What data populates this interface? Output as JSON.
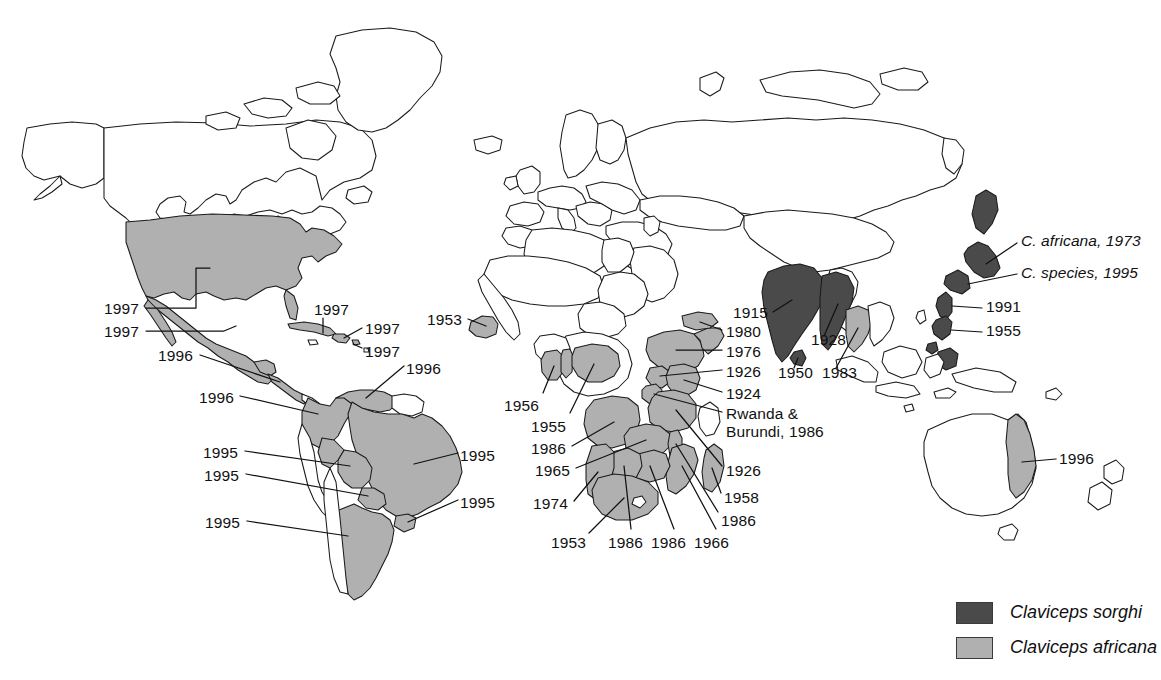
{
  "figure": {
    "colors": {
      "sorghi": "#4a4a4a",
      "africana": "#b0b0b0",
      "outline": "#1a1a1a",
      "background": "#ffffff",
      "text": "#111111"
    }
  },
  "legend": {
    "items": [
      {
        "key": "sorghi",
        "label": "Claviceps sorghi",
        "color": "#4a4a4a"
      },
      {
        "key": "africana",
        "label": "Claviceps africana",
        "color": "#b0b0b0"
      }
    ]
  },
  "annotations": [
    {
      "id": "usa",
      "label": "1997",
      "region": "United States",
      "species": "africana",
      "x": 104,
      "y": 300
    },
    {
      "id": "mexico",
      "label": "1997",
      "region": "Mexico",
      "species": "africana",
      "x": 104,
      "y": 323
    },
    {
      "id": "cuba",
      "label": "1997",
      "region": "Cuba",
      "species": "africana",
      "x": 314,
      "y": 301
    },
    {
      "id": "haiti-dr",
      "label": "1997",
      "region": "Hispaniola",
      "species": "africana",
      "x": 365,
      "y": 320
    },
    {
      "id": "puerto-rico",
      "label": "1997",
      "region": "Puerto Rico",
      "species": "africana",
      "x": 365,
      "y": 343
    },
    {
      "id": "central-america",
      "label": "1996",
      "region": "Central America",
      "species": "africana",
      "x": 158,
      "y": 347
    },
    {
      "id": "venezuela",
      "label": "1996",
      "region": "Venezuela",
      "species": "africana",
      "x": 406,
      "y": 360
    },
    {
      "id": "colombia",
      "label": "1996",
      "region": "Colombia",
      "species": "africana",
      "x": 199,
      "y": 389
    },
    {
      "id": "bolivia",
      "label": "1995",
      "region": "Bolivia",
      "species": "africana",
      "x": 203,
      "y": 444
    },
    {
      "id": "brazil",
      "label": "1995",
      "region": "Brazil",
      "species": "africana",
      "x": 460,
      "y": 447
    },
    {
      "id": "paraguay",
      "label": "1995",
      "region": "Paraguay",
      "species": "africana",
      "x": 204,
      "y": 467
    },
    {
      "id": "uruguay",
      "label": "1995",
      "region": "Uruguay",
      "species": "africana",
      "x": 460,
      "y": 494
    },
    {
      "id": "argentina",
      "label": "1995",
      "region": "Argentina",
      "species": "africana",
      "x": 205,
      "y": 514
    },
    {
      "id": "senegal-gambia",
      "label": "1953",
      "region": "Senegal / Gambia",
      "species": "africana",
      "x": 427,
      "y": 311
    },
    {
      "id": "ghana-togo",
      "label": "1956",
      "region": "Ghana / Togo",
      "species": "africana",
      "x": 504,
      "y": 397
    },
    {
      "id": "nigeria",
      "label": "1955",
      "region": "Nigeria",
      "species": "africana",
      "x": 531,
      "y": 418
    },
    {
      "id": "angola",
      "label": "1986",
      "region": "Angola",
      "species": "africana",
      "x": 531,
      "y": 440
    },
    {
      "id": "zambia",
      "label": "1965",
      "region": "Zambia",
      "species": "africana",
      "x": 535,
      "y": 462
    },
    {
      "id": "namibia",
      "label": "1974",
      "region": "Namibia",
      "species": "africana",
      "x": 533,
      "y": 495
    },
    {
      "id": "south-africa",
      "label": "1953",
      "region": "South Africa",
      "species": "africana",
      "x": 551,
      "y": 534
    },
    {
      "id": "botswana",
      "label": "1986",
      "region": "Botswana",
      "species": "africana",
      "x": 608,
      "y": 534
    },
    {
      "id": "zimbabwe",
      "label": "1986",
      "region": "Zimbabwe",
      "species": "africana",
      "x": 651,
      "y": 534
    },
    {
      "id": "mozambique",
      "label": "1966",
      "region": "Mozambique",
      "species": "africana",
      "x": 694,
      "y": 534
    },
    {
      "id": "malawi",
      "label": "1986",
      "region": "Malawi",
      "species": "africana",
      "x": 721,
      "y": 512
    },
    {
      "id": "madagascar",
      "label": "1958",
      "region": "Madagascar",
      "species": "africana",
      "x": 724,
      "y": 489
    },
    {
      "id": "tanzania",
      "label": "1926",
      "region": "Tanzania",
      "species": "africana",
      "x": 726,
      "y": 462
    },
    {
      "id": "rwanda-burundi",
      "label": "Rwanda &\nBurundi, 1986",
      "region": "Rwanda and Burundi",
      "species": "africana",
      "x": 726,
      "y": 412
    },
    {
      "id": "kenya",
      "label": "1924",
      "region": "Kenya",
      "species": "africana",
      "x": 726,
      "y": 393
    },
    {
      "id": "uganda",
      "label": "1926",
      "region": "Uganda",
      "species": "africana",
      "x": 726,
      "y": 372
    },
    {
      "id": "ethiopia",
      "label": "1976",
      "region": "Ethiopia",
      "species": "africana",
      "x": 726,
      "y": 352
    },
    {
      "id": "yemen",
      "label": "1980",
      "region": "Yemen",
      "species": "africana",
      "x": 726,
      "y": 333
    },
    {
      "id": "india",
      "label": "1915",
      "region": "India",
      "species": "sorghi",
      "x": 733,
      "y": 313
    },
    {
      "id": "myanmar",
      "label": "1928",
      "region": "Myanmar",
      "species": "sorghi",
      "x": 811,
      "y": 339
    },
    {
      "id": "sri-lanka",
      "label": "1950",
      "region": "Sri Lanka",
      "species": "sorghi",
      "x": 778,
      "y": 372
    },
    {
      "id": "thailand",
      "label": "1983",
      "region": "Thailand",
      "species": "africana",
      "x": 822,
      "y": 372
    },
    {
      "id": "korea",
      "label": "1991",
      "region": "Korea",
      "species": "sorghi",
      "x": 986,
      "y": 302
    },
    {
      "id": "philippines",
      "label": "1955",
      "region": "Philippines",
      "species": "sorghi",
      "x": 986,
      "y": 326
    },
    {
      "id": "japan-africana",
      "label": "C. africana, 1973",
      "region": "Japan",
      "species": "sorghi",
      "x": 1021,
      "y": 236,
      "italic": true
    },
    {
      "id": "japan-species",
      "label": "C. species, 1995",
      "region": "Japan",
      "species": "sorghi",
      "x": 1021,
      "y": 268,
      "italic": true
    },
    {
      "id": "australia",
      "label": "1996",
      "region": "Australia (Queensland)",
      "species": "africana",
      "x": 1059,
      "y": 452
    }
  ],
  "map": {
    "projection": "world-outline",
    "sorghi_countries": [
      "India",
      "Myanmar",
      "Sri Lanka",
      "Japan",
      "Korea",
      "Philippines"
    ],
    "africana_countries": [
      "United States",
      "Mexico",
      "Guatemala",
      "Honduras",
      "Nicaragua",
      "El Salvador",
      "Cuba",
      "Hispaniola",
      "Puerto Rico",
      "Colombia",
      "Venezuela",
      "Brazil",
      "Bolivia",
      "Paraguay",
      "Uruguay",
      "Argentina",
      "Senegal",
      "Gambia",
      "Ghana",
      "Togo",
      "Nigeria",
      "Angola",
      "Zambia",
      "Namibia",
      "Botswana",
      "Zimbabwe",
      "South Africa",
      "Mozambique",
      "Malawi",
      "Madagascar",
      "Tanzania",
      "Kenya",
      "Uganda",
      "Rwanda",
      "Burundi",
      "Ethiopia",
      "Somalia",
      "Yemen",
      "Thailand",
      "Australia"
    ]
  }
}
